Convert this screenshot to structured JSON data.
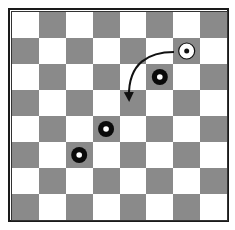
{
  "board": {
    "rows": 8,
    "cols": 8,
    "light_color": "#ffffff",
    "dark_color": "#8a8a8a",
    "first_square": "light"
  },
  "pieces": [
    {
      "name": "white-piece",
      "color": "white",
      "row": 1,
      "col": 6
    },
    {
      "name": "black-piece-1",
      "color": "black",
      "row": 2,
      "col": 5
    },
    {
      "name": "black-piece-2",
      "color": "black",
      "row": 4,
      "col": 3
    },
    {
      "name": "black-piece-3",
      "color": "black",
      "row": 5,
      "col": 2
    }
  ],
  "move_arrow": {
    "from": {
      "row": 1,
      "col": 6
    },
    "to": {
      "row": 3,
      "col": 4
    }
  }
}
